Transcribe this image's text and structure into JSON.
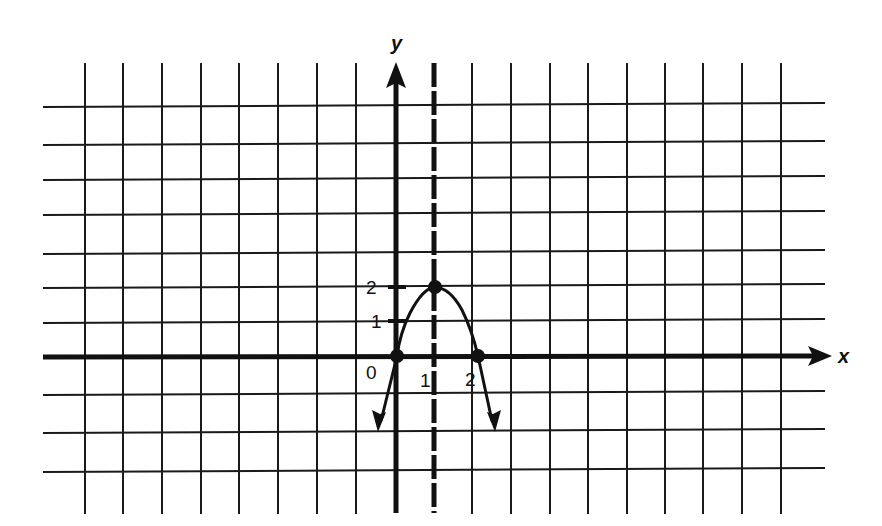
{
  "figure": {
    "axes": {
      "x_label": "x",
      "y_label": "y",
      "x_tick_labels": [
        "0",
        "1",
        "2"
      ],
      "y_tick_labels": [
        "1",
        "2"
      ]
    },
    "curve": {
      "type": "parabola",
      "equation_implied": "y = -2(x-1)^2 + 2",
      "vertex": [
        1,
        2
      ],
      "x_intercepts": [
        [
          0,
          0
        ],
        [
          2,
          0
        ]
      ],
      "passes_through": [
        [
          0,
          0
        ],
        [
          1,
          2
        ],
        [
          2,
          0
        ]
      ],
      "ends": "arrows pointing downward on both branches"
    },
    "axis_of_symmetry": {
      "equation": "x = 1",
      "style": "dashed"
    },
    "marked_points": [
      [
        0,
        0
      ],
      [
        1,
        2
      ],
      [
        2,
        0
      ]
    ],
    "grid": {
      "vertical_lines_px": [
        85,
        123,
        162,
        201,
        239,
        278,
        317,
        356,
        472,
        511,
        550,
        588,
        627,
        665,
        703,
        742,
        781
      ],
      "horizontal_lines_px": [
        107,
        145,
        180,
        215,
        254,
        288,
        323,
        395,
        433,
        472
      ],
      "color": "#1a1a1a"
    },
    "colors": {
      "ink": "#111111",
      "background": "#ffffff"
    }
  }
}
